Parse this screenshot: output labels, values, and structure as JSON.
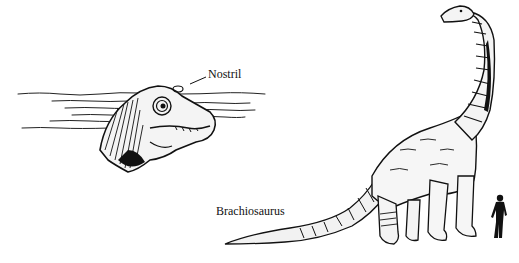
{
  "figure": {
    "labels": {
      "nostril": "Nostril",
      "species": "Brachiosaurus"
    },
    "elements": {
      "inset": "submerged-head-with-nostril-above-water",
      "main": "brachiosaurus-full-body",
      "scale": "human-silhouette"
    },
    "colors": {
      "ink": "#111111",
      "background": "#ffffff"
    }
  }
}
